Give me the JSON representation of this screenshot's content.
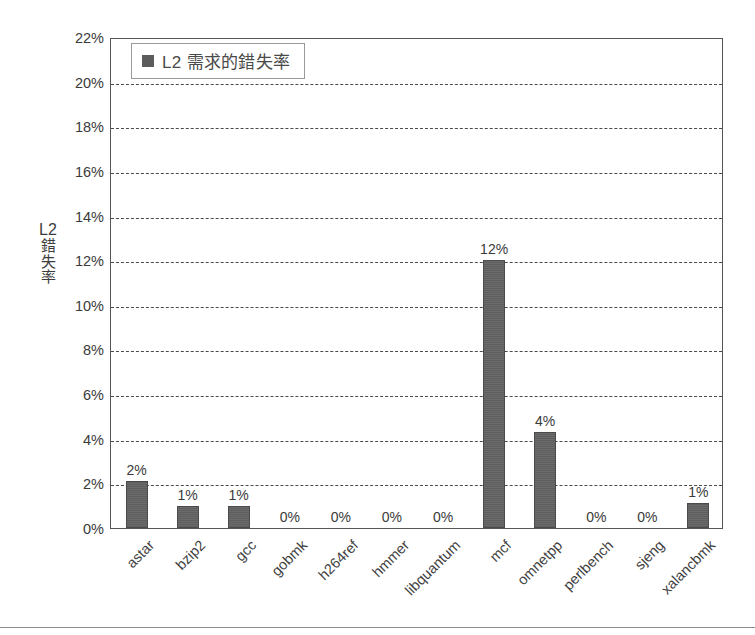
{
  "chart_data": {
    "type": "bar",
    "title": "",
    "xlabel": "",
    "ylabel": "L2 錯失率",
    "ylabel_parts": {
      "latin": "L2",
      "cjk": [
        "錯",
        "失",
        "率"
      ]
    },
    "ylim": [
      0,
      22
    ],
    "ytick_labels": [
      "22%",
      "20%",
      "18%",
      "16%",
      "14%",
      "12%",
      "10%",
      "8%",
      "6%",
      "4%",
      "2%",
      "0%"
    ],
    "ytick_values": [
      22,
      20,
      18,
      16,
      14,
      12,
      10,
      8,
      6,
      4,
      2,
      0
    ],
    "grid": true,
    "grid_axis": "y",
    "legend": {
      "position": "top-left-inside",
      "entries": [
        {
          "label": "L2 需求的錯失率",
          "color": "#5c5c5c",
          "marker": "square"
        }
      ]
    },
    "categories": [
      "astar",
      "bzip2",
      "gcc",
      "gobmk",
      "h264ref",
      "hmmer",
      "libquantum",
      "mcf",
      "omnetpp",
      "perlbench",
      "sjeng",
      "xalancbmk"
    ],
    "series": [
      {
        "name": "L2 需求的錯失率",
        "color": "#5c5c5c",
        "values": [
          2.1,
          1.0,
          1.0,
          0,
          0,
          0,
          0,
          12.0,
          4.3,
          0,
          0,
          1.1
        ],
        "data_labels": [
          "2%",
          "1%",
          "1%",
          "0%",
          "0%",
          "0%",
          "0%",
          "12%",
          "4%",
          "0%",
          "0%",
          "1%"
        ]
      }
    ]
  },
  "colors": {
    "bar": "#5c5c5c",
    "grid": "#4a4a4a",
    "axis": "#555555",
    "text": "#3a3a3a",
    "legend_border": "#9a9a9a",
    "rule": "#8c8c8c"
  }
}
